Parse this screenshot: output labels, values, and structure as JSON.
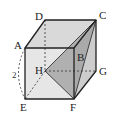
{
  "diagram": {
    "type": "cube",
    "vertices": {
      "A": "A",
      "B": "B",
      "C": "C",
      "D": "D",
      "E": "E",
      "F": "F",
      "G": "G",
      "H": "H"
    },
    "edge_length_label": "2",
    "measured_edge": "AE",
    "shaded_triangle": [
      "H",
      "C",
      "F"
    ],
    "hidden_edges": [
      "DH",
      "HG",
      "HE"
    ],
    "colors": {
      "face_fill": "#e4e4e4",
      "top_fill": "#d6d6d6",
      "right_fill": "#cfcfcf",
      "triangle_fill": "#9a9a9a",
      "edge": "#222222"
    }
  }
}
